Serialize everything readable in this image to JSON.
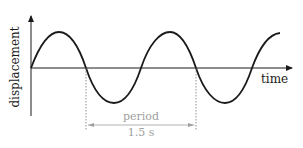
{
  "diagram": {
    "type": "sine-wave",
    "y_axis_label": "displacement",
    "x_axis_label": "time",
    "period_label": "period",
    "period_value": "1.5 s",
    "colors": {
      "curve": "#1a1a1a",
      "axes": "#1a1a1a",
      "annotation": "#a0a0a0",
      "background": "#ffffff"
    },
    "cycles_shown": 2.25
  }
}
